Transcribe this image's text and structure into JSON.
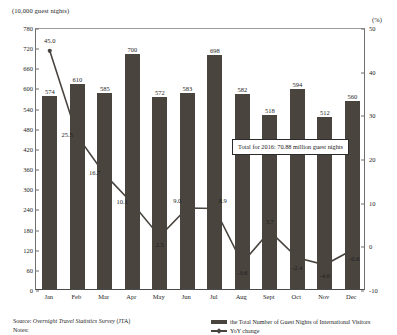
{
  "chart_data": {
    "type": "bar",
    "title": "",
    "xlabel": "",
    "ylabel": "(10,000 guest nights)",
    "y2label": "(%)",
    "categories": [
      "Jan",
      "Feb",
      "Mar",
      "Apr",
      "May",
      "Jun",
      "Jul",
      "Aug",
      "Sept",
      "Oct",
      "Nov",
      "Dec"
    ],
    "ylim": [
      0,
      780
    ],
    "yticks": [
      0,
      60,
      120,
      180,
      240,
      300,
      360,
      420,
      480,
      540,
      600,
      660,
      720,
      780
    ],
    "y2lim": [
      -10,
      50
    ],
    "y2ticks": [
      -10,
      0,
      10,
      20,
      30,
      40,
      50
    ],
    "grid": false,
    "legend_position": "bottom-right",
    "series": [
      {
        "name": "the Total Number of Guest Nights of International Visitors",
        "type": "bar",
        "axis": "left",
        "color": "#4a443f",
        "values": [
          574,
          610,
          585,
          700,
          572,
          583,
          698,
          582,
          518,
          594,
          512,
          560
        ]
      },
      {
        "name": "YoY change",
        "type": "line",
        "axis": "right",
        "color": "#4a443f",
        "values": [
          45.0,
          25.5,
          16.7,
          10.1,
          2.5,
          9.0,
          8.9,
          -3.6,
          3.7,
          -2.4,
          -4.0,
          -0.6
        ]
      }
    ],
    "annotations": [
      {
        "text": "Total for 2016: 70.88 million guest nights"
      }
    ]
  },
  "footer": {
    "source_prefix": "Source:",
    "source_italic": "Overnight Travel Statistics Survey",
    "source_suffix": "(JTA)",
    "notes_label": "Notes:"
  },
  "legend": {
    "bar_label": "the Total Number of Guest Nights of International Visitors",
    "line_label": "YoY change"
  }
}
